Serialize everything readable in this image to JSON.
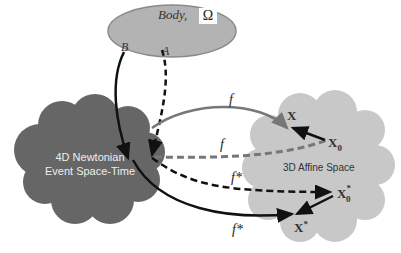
{
  "diagram": {
    "body": {
      "label": "Body,",
      "symbol": "Ω",
      "points": [
        "B",
        "A"
      ]
    },
    "event_space": {
      "line1": "4D Newtonian",
      "line2": "Event Space-Time"
    },
    "affine_space": {
      "label": "3D Affine Space"
    },
    "maps": {
      "f_top": "f",
      "f_dashed": "f",
      "f_star_dashed": "f*",
      "f_star_bottom": "f*"
    },
    "points": {
      "X": "X",
      "X0": "X",
      "X0_sub": "0",
      "X0_star": "X",
      "X0_star_sub": "0",
      "X0_star_sup": "*",
      "X_star": "X",
      "X_star_sup": "*"
    },
    "colors": {
      "body_fill": "#b3b3b3",
      "body_stroke": "#8a8a8a",
      "event_cloud": "#666666",
      "affine_cloud": "#c8c8c8",
      "arrow_dark": "#111111",
      "arrow_grey": "#777777"
    }
  }
}
